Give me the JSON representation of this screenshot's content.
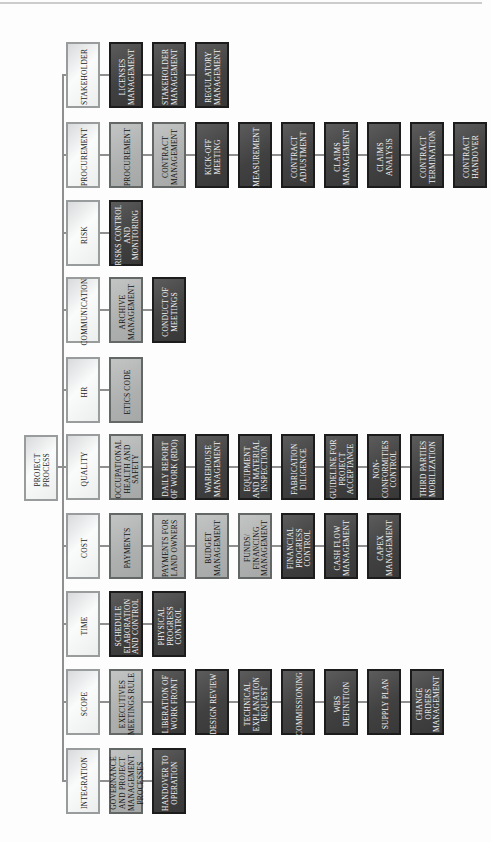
{
  "diagram_title": "PROJECT PROCESS",
  "root": {
    "label": "PROJECT PROCESS",
    "tone": "light"
  },
  "rows": [
    {
      "category": {
        "label": "STAKEHOLDER",
        "tone": "light"
      },
      "children": [
        {
          "label": "LICENSES MANAGEMENT",
          "tone": "dark"
        },
        {
          "label": "STAKEHOLDER MANAGEMENT",
          "tone": "dark"
        },
        {
          "label": "REGULATORY MANAGEMENT",
          "tone": "dark"
        }
      ]
    },
    {
      "category": {
        "label": "PROCUREMENT",
        "tone": "light"
      },
      "children": [
        {
          "label": "PROCUREMENT",
          "tone": "medium"
        },
        {
          "label": "CONTRACT MANAGEMENT",
          "tone": "medium"
        },
        {
          "label": "KICK-OFF MEETING",
          "tone": "dark"
        },
        {
          "label": "MEASUREMENT",
          "tone": "dark"
        },
        {
          "label": "CONTRACT ADJUSTMENT",
          "tone": "dark"
        },
        {
          "label": "CLAIMS MANAGEMENT",
          "tone": "dark"
        },
        {
          "label": "CLAIMS ANALYSIS",
          "tone": "dark"
        },
        {
          "label": "CONTRACT TERMINATION",
          "tone": "dark"
        },
        {
          "label": "CONTRACT HANDOVER",
          "tone": "dark"
        }
      ]
    },
    {
      "category": {
        "label": "RISK",
        "tone": "light"
      },
      "children": [
        {
          "label": "RISKS CONTROL AND MONITORING",
          "tone": "dark"
        }
      ]
    },
    {
      "category": {
        "label": "COMMUNICATION",
        "tone": "light"
      },
      "children": [
        {
          "label": "ARCHIVE MANAGEMENT",
          "tone": "medium"
        },
        {
          "label": "CONDUCT OF MEETINGS",
          "tone": "dark"
        }
      ]
    },
    {
      "category": {
        "label": "HR",
        "tone": "light"
      },
      "children": [
        {
          "label": "ETICS CODE",
          "tone": "medium"
        }
      ]
    },
    {
      "category": {
        "label": "QUALITY",
        "tone": "light"
      },
      "children": [
        {
          "label": "OCCUPATIONAL HEALTH AND SAFETY",
          "tone": "medium"
        },
        {
          "label": "DAILY REPORT OF WORK (RDO)",
          "tone": "dark"
        },
        {
          "label": "WAREHOUSE MANAGEMENT",
          "tone": "dark"
        },
        {
          "label": "EQUIPMENT AND MATERIAL INSPECTION",
          "tone": "dark"
        },
        {
          "label": "FABRICATION DILIGENCE",
          "tone": "dark"
        },
        {
          "label": "GUIDELINE FOR PROJECT ACCEPTANCE",
          "tone": "dark"
        },
        {
          "label": "NON-CONFORMITIES CONTROL",
          "tone": "dark"
        },
        {
          "label": "THIRD PARTIES MOBILIZATION",
          "tone": "dark"
        }
      ]
    },
    {
      "category": {
        "label": "COST",
        "tone": "light"
      },
      "children": [
        {
          "label": "PAYMENTS",
          "tone": "medium"
        },
        {
          "label": "PAYMENTS FOR LAND OWNERS",
          "tone": "medium"
        },
        {
          "label": "BUDGET MANAGEMENT",
          "tone": "medium"
        },
        {
          "label": "FUNDS/ FINANCING MANAGEMENT",
          "tone": "medium"
        },
        {
          "label": "FINANCIAL PROGRESS CONTROL",
          "tone": "dark"
        },
        {
          "label": "CASH FLOW MANAGEMENT",
          "tone": "dark"
        },
        {
          "label": "CAPEX MANAGEMENT",
          "tone": "dark"
        }
      ]
    },
    {
      "category": {
        "label": "TIME",
        "tone": "light"
      },
      "children": [
        {
          "label": "SCHEDULE ELABORATION AND CONTROL",
          "tone": "dark"
        },
        {
          "label": "PHYSICAL PROGRESS CONTROL",
          "tone": "dark"
        }
      ]
    },
    {
      "category": {
        "label": "SCOPE",
        "tone": "light"
      },
      "children": [
        {
          "label": "EXECUTIVES MEETINGS RULE",
          "tone": "medium"
        },
        {
          "label": "LIBERATION OF WORK FRONT",
          "tone": "dark"
        },
        {
          "label": "DESIGN REVIEW",
          "tone": "dark"
        },
        {
          "label": "TECHNICAL EXPLANATION REQUEST",
          "tone": "dark"
        },
        {
          "label": "COMMISSIONING",
          "tone": "dark"
        },
        {
          "label": "WBS DEFINITION",
          "tone": "dark"
        },
        {
          "label": "SUPPLY PLAN",
          "tone": "dark"
        },
        {
          "label": "CHANGE ORDERS MANAGEMENT",
          "tone": "dark"
        }
      ]
    },
    {
      "category": {
        "label": "INTEGRATION",
        "tone": "light"
      },
      "children": [
        {
          "label": "GOVERNANCE AND PROJECT MANAGEMENT PROCESSES",
          "tone": "medium"
        },
        {
          "label": "HANDOVER TO OPERATION",
          "tone": "dark"
        }
      ]
    }
  ],
  "colors": {
    "light_fill": "#ededee",
    "light_border": "#989c9d",
    "medium_fill": "#b0b2b1",
    "medium_border": "#636766",
    "dark_fill": "#414141",
    "dark_border": "#1c1c1c",
    "dark_text": "#f3f3f3",
    "connector": "#8f8f8f",
    "top_rule": "#cccccc"
  }
}
